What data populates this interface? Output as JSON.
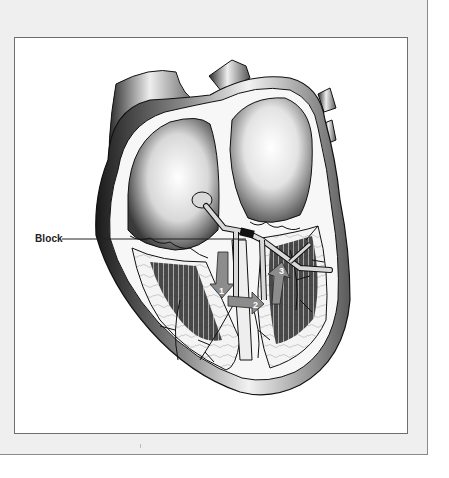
{
  "figure": {
    "labels": {
      "block": "Block"
    },
    "arrows": [
      {
        "number": "1",
        "direction": "down"
      },
      {
        "number": "2",
        "direction": "right"
      },
      {
        "number": "3",
        "direction": "up"
      }
    ],
    "colors": {
      "panel_background": "#efefef",
      "frame_background": "#ffffff",
      "frame_border": "#6e6e6e",
      "arrow_fill": "#8c8c8c",
      "conduction_pathway": "#d9d9d9",
      "block_marker": "#111111"
    }
  }
}
